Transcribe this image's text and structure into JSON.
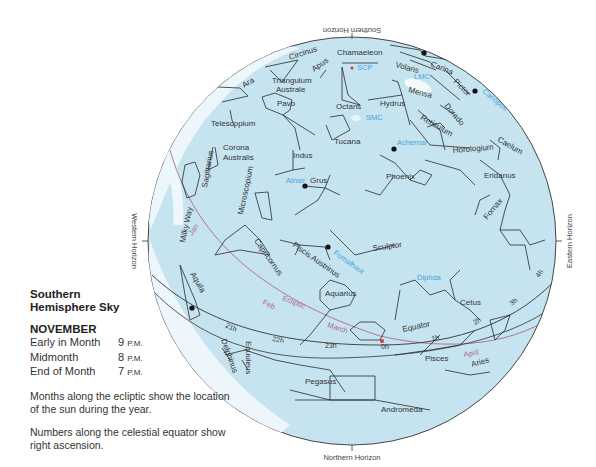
{
  "legend": {
    "title_line1": "Southern",
    "title_line2": "Hemisphere Sky",
    "month": "NOVEMBER",
    "times": [
      {
        "label": "Early in Month",
        "hour": "9",
        "ampm": "P.M."
      },
      {
        "label": "Midmonth",
        "hour": "8",
        "ampm": "P.M."
      },
      {
        "label": "End of Month",
        "hour": "7",
        "ampm": "P.M."
      }
    ],
    "note1": "Months along the ecliptic show the location of the sun during the year.",
    "note2": "Numbers along the celestial equator show right ascension."
  },
  "horizons": {
    "south": "Southern Horizon",
    "north": "Northern Horizon",
    "east": "Eastern Horizon",
    "west": "Western Horizon"
  },
  "colors": {
    "sky": "#c6e4f0",
    "milky_way": "#eef7fb",
    "ecliptic": "#b0688a",
    "star_label_blue": "#4aa3d8",
    "line": "#2a2a2a",
    "scp": "#d23a3a"
  },
  "sky_circle": {
    "cx": 352,
    "cy": 241,
    "r": 204
  },
  "constellation_labels": [
    {
      "text": "Circinus",
      "x": 290,
      "y": 60,
      "rot": -18
    },
    {
      "text": "Chamaeleon",
      "x": 337,
      "y": 55,
      "rot": 0
    },
    {
      "text": "Apus",
      "x": 314,
      "y": 72,
      "rot": -35
    },
    {
      "text": "Volans",
      "x": 395,
      "y": 67,
      "rot": 15
    },
    {
      "text": "Carina",
      "x": 430,
      "y": 66,
      "rot": 22
    },
    {
      "text": "Pictor",
      "x": 453,
      "y": 82,
      "rot": 45
    },
    {
      "text": "Triangulum",
      "x": 272,
      "y": 83,
      "rot": 0
    },
    {
      "text": "Australe",
      "x": 276,
      "y": 92,
      "rot": 0
    },
    {
      "text": "Ara",
      "x": 244,
      "y": 88,
      "rot": -30
    },
    {
      "text": "Pavo",
      "x": 277,
      "y": 106,
      "rot": 0
    },
    {
      "text": "Octans",
      "x": 336,
      "y": 109,
      "rot": 0
    },
    {
      "text": "Hydrus",
      "x": 380,
      "y": 106,
      "rot": 0
    },
    {
      "text": "Mensa",
      "x": 408,
      "y": 92,
      "rot": 15
    },
    {
      "text": "Dorado",
      "x": 444,
      "y": 106,
      "rot": 50
    },
    {
      "text": "Reticulum",
      "x": 420,
      "y": 119,
      "rot": 30
    },
    {
      "text": "Telescopium",
      "x": 211,
      "y": 126,
      "rot": 0
    },
    {
      "text": "Tucana",
      "x": 334,
      "y": 144,
      "rot": 0
    },
    {
      "text": "Caelum",
      "x": 497,
      "y": 141,
      "rot": 30
    },
    {
      "text": "Corona",
      "x": 223,
      "y": 150,
      "rot": 0
    },
    {
      "text": "Australis",
      "x": 223,
      "y": 160,
      "rot": 0
    },
    {
      "text": "Horologium",
      "x": 453,
      "y": 153,
      "rot": -5
    },
    {
      "text": "Indus",
      "x": 293,
      "y": 158,
      "rot": 0
    },
    {
      "text": "Sagittarius",
      "x": 207,
      "y": 188,
      "rot": -80
    },
    {
      "text": "Microscopium",
      "x": 243,
      "y": 215,
      "rot": -78
    },
    {
      "text": "Grus",
      "x": 310,
      "y": 183,
      "rot": 0
    },
    {
      "text": "Phoenix",
      "x": 386,
      "y": 179,
      "rot": 0
    },
    {
      "text": "Eridanus",
      "x": 484,
      "y": 178,
      "rot": 0
    },
    {
      "text": "Fornax",
      "x": 487,
      "y": 220,
      "rot": -50
    },
    {
      "text": "Milky Way",
      "x": 185,
      "y": 243,
      "rot": -78
    },
    {
      "text": "Capricornus",
      "x": 254,
      "y": 241,
      "rot": 55
    },
    {
      "text": "Piscis Austrinus",
      "x": 292,
      "y": 246,
      "rot": 35
    },
    {
      "text": "Sculptor",
      "x": 373,
      "y": 251,
      "rot": -8
    },
    {
      "text": "Aquila",
      "x": 190,
      "y": 274,
      "rot": 60
    },
    {
      "text": "Aquarius",
      "x": 325,
      "y": 296,
      "rot": 0
    },
    {
      "text": "Cetus",
      "x": 460,
      "y": 305,
      "rot": 0
    },
    {
      "text": "Equator",
      "x": 403,
      "y": 332,
      "rot": -12
    },
    {
      "text": "Delphinus",
      "x": 221,
      "y": 340,
      "rot": 70
    },
    {
      "text": "Equuleus",
      "x": 246,
      "y": 341,
      "rot": 90
    },
    {
      "text": "Pisces",
      "x": 425,
      "y": 361,
      "rot": 0
    },
    {
      "text": "Aries",
      "x": 472,
      "y": 367,
      "rot": -15
    },
    {
      "text": "Pegasus",
      "x": 305,
      "y": 384,
      "rot": 0
    },
    {
      "text": "Andromeda",
      "x": 381,
      "y": 412,
      "rot": 0
    }
  ],
  "star_labels": [
    {
      "text": "SCP",
      "x": 357,
      "y": 70,
      "rot": 0
    },
    {
      "text": "LMC",
      "x": 414,
      "y": 79,
      "rot": 0
    },
    {
      "text": "Canopus",
      "x": 482,
      "y": 92,
      "rot": 40
    },
    {
      "text": "SMC",
      "x": 366,
      "y": 120,
      "rot": 0
    },
    {
      "text": "Achernar",
      "x": 397,
      "y": 145,
      "rot": 0
    },
    {
      "text": "Alnair",
      "x": 286,
      "y": 183,
      "rot": 0
    },
    {
      "text": "Fomalhaut",
      "x": 333,
      "y": 254,
      "rot": 35
    },
    {
      "text": "Diphda",
      "x": 417,
      "y": 280,
      "rot": 0
    }
  ],
  "ecliptic_labels": [
    {
      "text": "Jan",
      "x": 192,
      "y": 236,
      "rot": -55
    },
    {
      "text": "Ecliptic",
      "x": 282,
      "y": 300,
      "rot": 22
    },
    {
      "text": "Feb",
      "x": 262,
      "y": 304,
      "rot": 25
    },
    {
      "text": "March",
      "x": 327,
      "y": 327,
      "rot": 18
    },
    {
      "text": "April",
      "x": 464,
      "y": 357,
      "rot": -10
    }
  ],
  "ra_labels": [
    {
      "text": "21h",
      "x": 225,
      "y": 327,
      "rot": 25
    },
    {
      "text": "22h",
      "x": 272,
      "y": 341,
      "rot": 10
    },
    {
      "text": "23h",
      "x": 325,
      "y": 348,
      "rot": 0
    },
    {
      "text": "0h",
      "x": 381,
      "y": 349,
      "rot": 0
    },
    {
      "text": "1h",
      "x": 432,
      "y": 341,
      "rot": -12
    },
    {
      "text": "2h",
      "x": 475,
      "y": 325,
      "rot": -30
    },
    {
      "text": "3h",
      "x": 512,
      "y": 306,
      "rot": -40
    },
    {
      "text": "4h",
      "x": 539,
      "y": 278,
      "rot": -55
    }
  ],
  "bright_stars": [
    {
      "x": 424,
      "y": 53
    },
    {
      "x": 475,
      "y": 91
    },
    {
      "x": 394,
      "y": 149
    },
    {
      "x": 305,
      "y": 186
    },
    {
      "x": 328,
      "y": 247
    },
    {
      "x": 192,
      "y": 308
    }
  ]
}
